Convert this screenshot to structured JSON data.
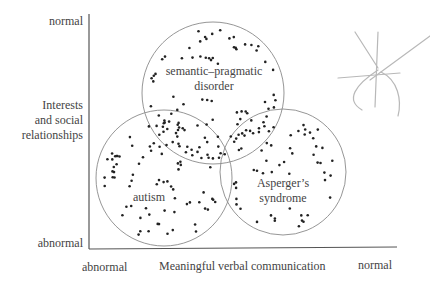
{
  "axes": {
    "y_label_lines": [
      "Interests",
      "and social",
      "relationships"
    ],
    "y_top": "normal",
    "y_bottom": "abnormal",
    "x_label": "Meaningful verbal communication",
    "x_left": "abnormal",
    "x_right": "normal"
  },
  "groups": [
    {
      "id": "semantic-pragmatic",
      "label_lines": [
        "semantic–pragmatic",
        "disorder"
      ]
    },
    {
      "id": "autism",
      "label_lines": [
        "autism"
      ]
    },
    {
      "id": "asperger",
      "label_lines": [
        "Asperger’s",
        "syndrome"
      ]
    }
  ],
  "scatter_points_note": "Dot positions are approximate, not read from the screenshot",
  "decoration": {
    "name": "hand-drawn-sketch"
  },
  "colors": {
    "axis": "#555555",
    "circle": "#8a8a8a",
    "dot": "#222222",
    "sketch": "#b8b8b8"
  }
}
